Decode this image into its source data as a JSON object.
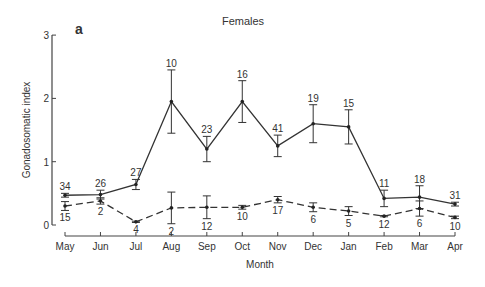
{
  "chart_data": {
    "type": "line",
    "panel_label": "a",
    "title": "Females",
    "xlabel": "Month",
    "ylabel": "Gonadosomatic index",
    "ylim": [
      0,
      3
    ],
    "yticks": [
      0,
      1,
      2,
      3
    ],
    "grid": false,
    "categories": [
      "May",
      "Jun",
      "Jul",
      "Aug",
      "Sep",
      "Oct",
      "Nov",
      "Dec",
      "Jan",
      "Feb",
      "Mar",
      "Apr"
    ],
    "series": [
      {
        "name": "solid",
        "style": "solid",
        "values": [
          0.47,
          0.48,
          0.64,
          1.95,
          1.2,
          1.95,
          1.25,
          1.6,
          1.55,
          0.42,
          0.44,
          0.33
        ],
        "err": [
          0.03,
          0.07,
          0.08,
          0.5,
          0.2,
          0.33,
          0.17,
          0.3,
          0.27,
          0.13,
          0.18,
          0.03
        ],
        "n": [
          34,
          26,
          27,
          10,
          23,
          16,
          41,
          19,
          15,
          11,
          18,
          31
        ]
      },
      {
        "name": "dashed",
        "style": "dashed",
        "values": [
          0.3,
          0.38,
          0.05,
          0.27,
          0.28,
          0.28,
          0.4,
          0.28,
          0.22,
          0.14,
          0.26,
          0.12
        ],
        "err": [
          0.07,
          0.05,
          0.01,
          0.25,
          0.18,
          0.03,
          0.05,
          0.07,
          0.07,
          0.01,
          0.12,
          0.02
        ],
        "n": [
          15,
          2,
          4,
          2,
          12,
          10,
          17,
          6,
          5,
          12,
          6,
          10
        ]
      }
    ]
  }
}
